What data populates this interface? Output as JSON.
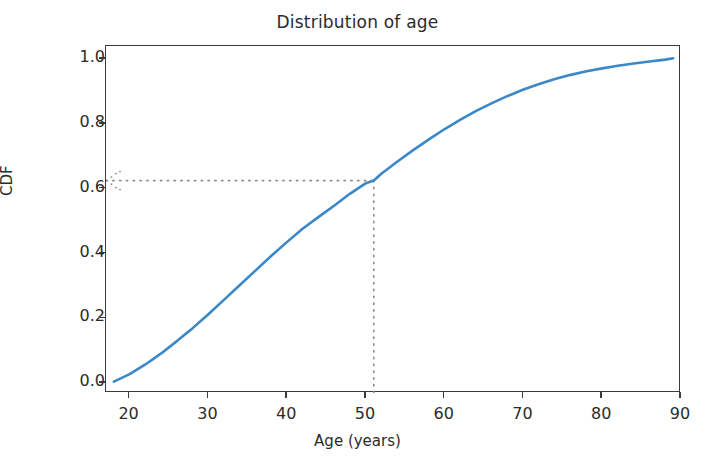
{
  "chart_data": {
    "type": "line",
    "title": "Distribution of age",
    "xlabel": "Age (years)",
    "ylabel": "CDF",
    "xlim": [
      17,
      90
    ],
    "ylim": [
      -0.03,
      1.04
    ],
    "xticks": [
      20,
      30,
      40,
      50,
      60,
      70,
      80,
      90
    ],
    "xtick_labels": [
      "20",
      "30",
      "40",
      "50",
      "60",
      "70",
      "80",
      "90"
    ],
    "yticks": [
      0.0,
      0.2,
      0.4,
      0.6,
      0.8,
      1.0
    ],
    "ytick_labels": [
      "0.0",
      "0.2",
      "0.4",
      "0.6",
      "0.8",
      "1.0"
    ],
    "grid": false,
    "legend": false,
    "line_color": "#3b88c8",
    "line_width": 2.6,
    "series": [
      {
        "name": "CDF of age",
        "x": [
          18,
          20,
          22,
          24,
          26,
          28,
          30,
          32,
          34,
          36,
          38,
          40,
          42,
          44,
          46,
          48,
          50,
          51,
          52,
          54,
          56,
          58,
          60,
          62,
          64,
          66,
          68,
          70,
          72,
          74,
          76,
          78,
          80,
          82,
          84,
          86,
          88,
          89
        ],
        "y": [
          0.005,
          0.028,
          0.058,
          0.092,
          0.13,
          0.17,
          0.213,
          0.258,
          0.303,
          0.348,
          0.393,
          0.436,
          0.477,
          0.513,
          0.548,
          0.585,
          0.617,
          0.625,
          0.647,
          0.684,
          0.719,
          0.752,
          0.784,
          0.813,
          0.84,
          0.864,
          0.886,
          0.906,
          0.923,
          0.938,
          0.951,
          0.962,
          0.971,
          0.979,
          0.986,
          0.992,
          0.998,
          1.002
        ]
      }
    ],
    "annotations": [
      {
        "name": "percentile-marker",
        "style": "dotted-crosshair",
        "color": "#8a8a8a",
        "x_value": 51,
        "y_value": 0.625,
        "horizontal_from_x": 17,
        "vertical_to_y": -0.03,
        "arrowhead": "left"
      }
    ]
  },
  "figure": {
    "background": "#ffffff",
    "axes_color": "#3b3b3b",
    "text_color": "#2b2b2b"
  }
}
